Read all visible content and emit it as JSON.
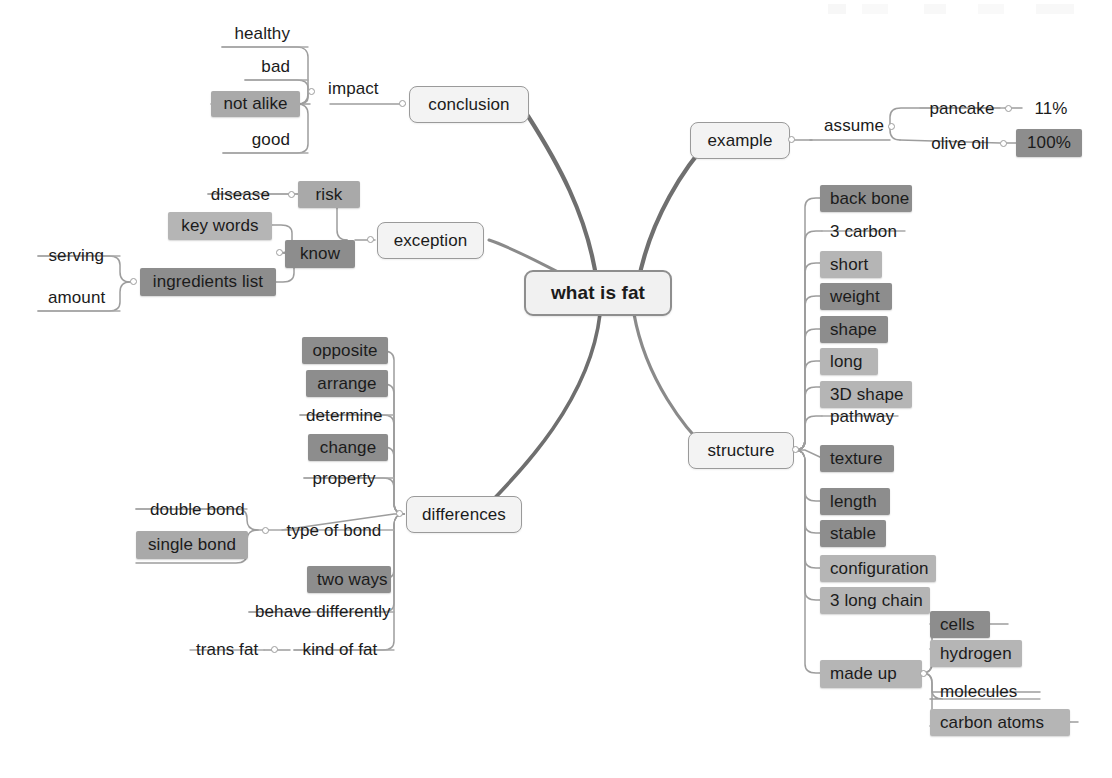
{
  "diagram": {
    "title": "what is fat",
    "type": "mind-map",
    "colors": {
      "root_fill": "#f1f1f1",
      "root_border": "#8e8e8e",
      "branch_fill": "#f3f3f3",
      "branch_border": "#9a9a9a",
      "chip_dark": "#8d8d8d",
      "chip_mid": "#a9a9a9",
      "chip_light": "#b5b5b5",
      "text": "#1b1b1b",
      "connector": "#9d9d9d",
      "connector_thick": "#6f6f6f",
      "background": "#ffffff"
    }
  },
  "root": {
    "label": "what is fat"
  },
  "branches": {
    "conclusion": {
      "label": "conclusion"
    },
    "exception": {
      "label": "exception"
    },
    "differences": {
      "label": "differences"
    },
    "example": {
      "label": "example"
    },
    "structure": {
      "label": "structure"
    }
  },
  "nodes": {
    "impact": "impact",
    "healthy": "healthy",
    "bad": "bad",
    "not_alike": "not alike",
    "good": "good",
    "risk": "risk",
    "disease": "disease",
    "know": "know",
    "key_words": "key words",
    "ingredients_list": "ingredients list",
    "serving": "serving",
    "amount": "amount",
    "opposite": "opposite",
    "arrange": "arrange",
    "determine": "determine",
    "change": "change",
    "property": "property",
    "type_of_bond": "type of bond",
    "double_bond": "double bond",
    "single_bond": "single bond",
    "two_ways": "two ways",
    "behave_differently": "behave differently",
    "kind_of_fat": "kind of fat",
    "trans_fat": "trans fat",
    "assume": "assume",
    "pancake": "pancake",
    "pancake_value": "11%",
    "olive_oil": "olive oil",
    "olive_oil_value": "100%",
    "back_bone": "back bone",
    "three_carbon": "3 carbon",
    "short": "short",
    "weight": "weight",
    "shape": "shape",
    "long": "long",
    "three_d_shape": "3D shape",
    "pathway": "pathway",
    "texture": "texture",
    "length": "length",
    "stable": "stable",
    "configuration": "configuration",
    "three_long_chain": "3 long chain",
    "made_up": "made up",
    "cells": "cells",
    "hydrogen": "hydrogen",
    "molecules": "molecules",
    "carbon_atoms": "carbon atoms"
  }
}
